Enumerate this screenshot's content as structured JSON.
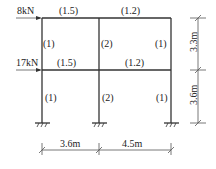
{
  "loads": [
    {
      "label": "8kN",
      "level": "roof"
    },
    {
      "label": "17kN",
      "level": "floor-1"
    }
  ],
  "beams": {
    "top": [
      {
        "label": "(1.5)"
      },
      {
        "label": "(1.2)"
      }
    ],
    "middle": [
      {
        "label": "(1.5)"
      },
      {
        "label": "(1.2)"
      }
    ]
  },
  "columns": {
    "upper": [
      {
        "label": "(1)"
      },
      {
        "label": "(2)"
      },
      {
        "label": "(1)"
      }
    ],
    "lower": [
      {
        "label": "(1)"
      },
      {
        "label": "(2)"
      },
      {
        "label": "(1)"
      }
    ]
  },
  "dimensions": {
    "spans": [
      "3.6m",
      "4.5m"
    ],
    "heights": [
      "3.3m",
      "3.6m"
    ]
  }
}
